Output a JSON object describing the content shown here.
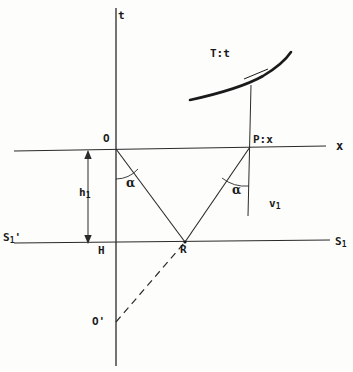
{
  "figure": {
    "kind": "ray-diagram",
    "title_text": "",
    "background_color": "#fdfdfc",
    "ink_color": "#1a1a1a"
  },
  "labels": {
    "t_axis": "t",
    "travel_time_curve": "T:t",
    "origin": "O",
    "point_P": "P:x",
    "x_axis": "x",
    "angle_at_O": "α",
    "angle_at_P": "α",
    "depth_main": "h",
    "depth_sub": "1",
    "velocity_main": "v",
    "velocity_sub": "1",
    "interface_left_main": "S",
    "interface_left_sub": "1",
    "interface_left_prime": "'",
    "interface_right_main": "S",
    "interface_right_sub": "1",
    "foot_of_perpendicular": "H",
    "reflection_point": "R",
    "image_source": "O'"
  },
  "geometry": {
    "x_axis": {
      "x1": 14,
      "y1": 151,
      "x2": 326,
      "y2": 146
    },
    "t_axis": {
      "x1": 116,
      "y1": 8,
      "x2": 116,
      "y2": 366
    },
    "interface_line": {
      "x1": 14,
      "y1": 243,
      "x2": 330,
      "y2": 240
    },
    "p_vertical": {
      "x1": 251,
      "y1": 85,
      "x2": 248,
      "y2": 216
    },
    "ray_incident": {
      "x1": 116,
      "y1": 149,
      "x2": 185,
      "y2": 242
    },
    "ray_reflected": {
      "x1": 185,
      "y1": 242,
      "x2": 250,
      "y2": 147
    },
    "virtual_ray_dashed": {
      "x1": 116,
      "y1": 322,
      "x2": 185,
      "y2": 242
    },
    "depth_arrow": {
      "x": 88,
      "y_top": 152,
      "y_bottom": 242
    },
    "travel_time_curve_path": "M 190 100 Q 240 88 262 76 Q 282 65 290 53",
    "tangent_tick": {
      "x1": 243,
      "y1": 78,
      "x2": 267,
      "y2": 70
    },
    "angle_arc_O": {
      "cx": 116,
      "cy": 149,
      "radius": 30
    },
    "angle_arc_P": {
      "cx": 249,
      "cy": 148,
      "radius": 38
    },
    "points": {
      "O": {
        "x": 116,
        "y": 149
      },
      "P": {
        "x": 250,
        "y": 147
      },
      "R": {
        "x": 185,
        "y": 242
      },
      "H": {
        "x": 116,
        "y": 242
      },
      "O_prime": {
        "x": 116,
        "y": 322
      }
    }
  }
}
